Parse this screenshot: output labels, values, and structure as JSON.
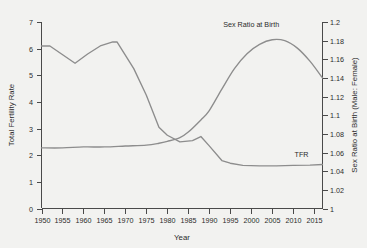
{
  "chart_data": {
    "type": "line",
    "title": "",
    "xlabel": "Year",
    "ylabel": "Total Fertility Rate",
    "y2label": "Sex Ratio at Birth (Male: Female)",
    "xlim": [
      1950,
      2017
    ],
    "ylim": [
      0,
      7
    ],
    "y2lim": [
      1,
      1.2
    ],
    "grid": false,
    "legend": "inline-annotations",
    "x_ticks": [
      1950,
      1955,
      1960,
      1965,
      1970,
      1975,
      1980,
      1985,
      1990,
      1995,
      2000,
      2005,
      2010,
      2015
    ],
    "x_tick_labels": [
      "1950",
      "1955",
      "1960",
      "1965",
      "1970",
      "1975",
      "1980",
      "1985",
      "1990",
      "1995",
      "2000",
      "2005",
      "2010",
      "2015"
    ],
    "y_ticks": [
      0,
      1,
      2,
      3,
      4,
      5,
      6,
      7
    ],
    "y_tick_labels": [
      "0",
      "1",
      "2",
      "3",
      "4",
      "5",
      "6",
      "7"
    ],
    "y2_ticks": [
      1,
      1.02,
      1.04,
      1.06,
      1.08,
      1.1,
      1.12,
      1.14,
      1.16,
      1.18,
      1.2
    ],
    "y2_tick_labels": [
      "1",
      "1.02",
      "1.04",
      "1.06",
      "1.08",
      "1.1",
      "1.12",
      "1.14",
      "1.16",
      "1.18",
      "1.2"
    ],
    "series": [
      {
        "name": "TFR",
        "axis": "left",
        "label_text": "TFR",
        "color": "#8d8d8d",
        "x": [
          1950,
          1952,
          1958,
          1961,
          1964,
          1967,
          1968,
          1972,
          1975,
          1978,
          1980,
          1983,
          1986,
          1988,
          1990,
          1993,
          1995,
          1998,
          2002,
          2006,
          2010,
          2014,
          2017
        ],
        "values": [
          6.1,
          6.1,
          5.45,
          5.8,
          6.1,
          6.25,
          6.25,
          5.25,
          4.25,
          3.05,
          2.75,
          2.5,
          2.55,
          2.7,
          2.35,
          1.8,
          1.7,
          1.62,
          1.6,
          1.6,
          1.62,
          1.63,
          1.65
        ]
      },
      {
        "name": "Sex Ratio at Birth",
        "axis": "right",
        "label_text": "Sex Ratio at Birth",
        "color": "#8d8d8d",
        "x": [
          1950,
          1955,
          1960,
          1965,
          1970,
          1975,
          1978,
          1980,
          1983,
          1985,
          1988,
          1990,
          1993,
          1996,
          1999,
          2002,
          2005,
          2008,
          2011,
          2014,
          2017
        ],
        "values": [
          1.065,
          1.065,
          1.066,
          1.066,
          1.067,
          1.068,
          1.07,
          1.072,
          1.076,
          1.082,
          1.095,
          1.105,
          1.128,
          1.15,
          1.166,
          1.176,
          1.181,
          1.18,
          1.172,
          1.158,
          1.14
        ]
      }
    ],
    "annotations": [
      {
        "text": "Sex Ratio at Birth",
        "near_x": 2000,
        "near_y2": 1.195
      },
      {
        "text": "TFR",
        "near_x": 2012,
        "near_y": 1.95
      }
    ]
  },
  "axes": {
    "left_title": "Total Fertility Rate",
    "right_title": "Sex Ratio at Birth (Male: Female)",
    "bottom_title": "Year"
  },
  "colors": {
    "background": "#f2f2f0",
    "line": "#8d8d8d",
    "axis": "#4a4a4a",
    "text": "#2b2b2b"
  }
}
